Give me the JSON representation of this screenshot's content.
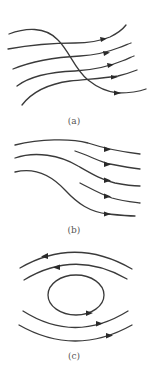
{
  "figure": {
    "panels": [
      {
        "id": "a",
        "caption": "(a)",
        "description": "Five streamlines flowing right; one S-shaped streamline crosses the other four"
      },
      {
        "id": "b",
        "caption": "(b)",
        "description": "Five streamlines flowing right, diverging/converging downward; two short lines start mid-panel"
      },
      {
        "id": "c",
        "caption": "(c)",
        "description": "Closed elliptical streamline with two arcs above (flowing left) and two arcs below (flowing right)"
      }
    ],
    "colors": {
      "line": "#3a3a3a",
      "caption": "#555555",
      "background": "#ffffff"
    }
  }
}
